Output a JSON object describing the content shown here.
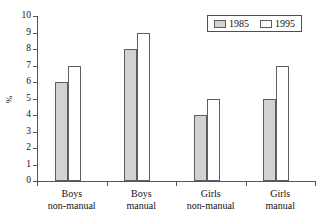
{
  "chart_data": {
    "type": "bar",
    "title": "",
    "xlabel": "",
    "ylabel": "%",
    "ylim": [
      0,
      10
    ],
    "yticks": [
      0,
      1,
      2,
      3,
      4,
      5,
      6,
      7,
      8,
      9,
      10
    ],
    "ytick_labels": [
      "0",
      "1",
      "2",
      "3",
      "4",
      "5",
      "6",
      "7",
      "8",
      "9",
      "10"
    ],
    "grid": false,
    "legend_position": "top-right",
    "categories": [
      "Boys non-manual",
      "Boys manual",
      "Girls non-manual",
      "Girls manual"
    ],
    "category_lines": [
      {
        "line1": "Boys",
        "line2": "non-manual"
      },
      {
        "line1": "Boys",
        "line2": "manual"
      },
      {
        "line1": "Girls",
        "line2": "non-manual"
      },
      {
        "line1": "Girls",
        "line2": "manual"
      }
    ],
    "series": [
      {
        "name": "1985",
        "color": "#d2d2d2",
        "values": [
          6,
          8,
          4,
          5
        ]
      },
      {
        "name": "1995",
        "color": "#ffffff",
        "values": [
          7,
          9,
          5,
          7
        ]
      }
    ]
  },
  "legend": {
    "items": [
      {
        "label": "1985",
        "swatch": "gray-filled-swatch"
      },
      {
        "label": "1995",
        "swatch": "white-open-swatch"
      }
    ]
  },
  "axes": {
    "y_label_text": "%"
  },
  "colors": {
    "series_1985_fill": "#d2d2d2",
    "series_1995_fill": "#ffffff",
    "bar_outline": "#5d5c61",
    "axis_line": "#55545a",
    "text": "#111111",
    "background": "#ffffff"
  }
}
